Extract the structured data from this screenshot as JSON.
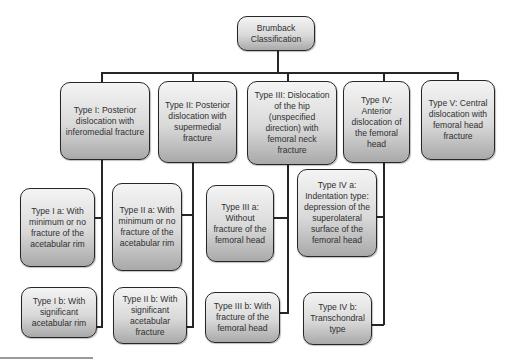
{
  "diagram": {
    "type": "hierarchy",
    "root": {
      "label": "Brumback Classification"
    },
    "types": [
      {
        "label": "Type I: Posterior dislocation with inferomedial fracture",
        "subtypes": [
          {
            "label": "Type I a: With minimum or no fracture of the acetabular rim"
          },
          {
            "label": "Type I b: With significant acetabular rim"
          }
        ]
      },
      {
        "label": "Type II: Posterior dislocation with supermedial fracture",
        "subtypes": [
          {
            "label": "Type II a: With minimum or no fracture of the acetabular rim"
          },
          {
            "label": "Type II b: With significant acetabular fracture"
          }
        ]
      },
      {
        "label": "Type III: Dislocation of the hip (unspecified direction) with femoral neck fracture",
        "subtypes": [
          {
            "label": "Type III a: Without fracture of the femoral head"
          },
          {
            "label": "Type III b: With fracture of the femoral head"
          }
        ]
      },
      {
        "label": "Type IV: Anterior dislocation of the femoral head",
        "subtypes": [
          {
            "label": "Type IV a: Indentation type: depression of the superolateral surface of the femoral head"
          },
          {
            "label": "Type IV b: Transchondral type"
          }
        ]
      },
      {
        "label": "Type V: Central dislocation with femoral head fracture",
        "subtypes": []
      }
    ]
  },
  "colors": {
    "box_border": "#262626",
    "box_gradient_top": "#f4f4f4",
    "box_gradient_bottom": "#a9a9a9",
    "text": "#303030",
    "connector": "#262626"
  }
}
